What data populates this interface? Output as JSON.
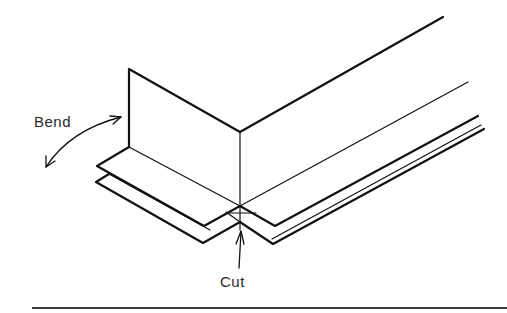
{
  "diagram": {
    "type": "technical-illustration",
    "labels": {
      "bend": "Bend",
      "cut": "Cut"
    },
    "colors": {
      "line": "#111111",
      "background": "#ffffff",
      "rule": "#3a3a3a"
    }
  }
}
